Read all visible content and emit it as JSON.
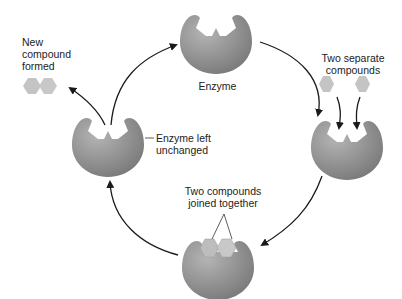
{
  "diagram": {
    "type": "enzyme-catalysis-cycle",
    "labels": {
      "enzyme": "Enzyme",
      "two_separate": [
        "Two separate",
        "compounds"
      ],
      "joined": [
        "Two compounds",
        "joined together"
      ],
      "unchanged": [
        "Enzyme left",
        "unchanged"
      ],
      "new_compound": [
        "New",
        "compound",
        "formed"
      ]
    },
    "colors": {
      "enzyme": "#8a8a8a",
      "enzyme_light": "#b0b0b0",
      "compound": "#c4c4c4",
      "arrow": "#1a1a1a",
      "text": "#222222"
    },
    "stages": [
      {
        "name": "free-enzyme",
        "position": "top"
      },
      {
        "name": "substrates-binding",
        "position": "right"
      },
      {
        "name": "compounds-joined",
        "position": "bottom"
      },
      {
        "name": "enzyme-released",
        "position": "left"
      }
    ]
  }
}
